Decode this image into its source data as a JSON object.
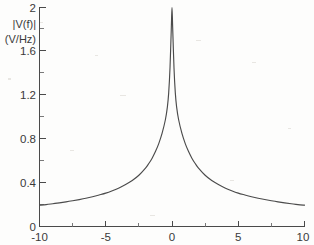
{
  "figure": {
    "background_color": "#fdfdfc",
    "curve_color": "#4b4b4b",
    "axis_color": "#4a4a4a"
  },
  "axes": {
    "y_axis_title_line1": "|V(f)|",
    "y_axis_title_line2": "(V/Hz)",
    "x_axis_title": "",
    "y_ticks": [
      "0",
      "0.4",
      "0.8",
      "1.2",
      "1.6",
      "2"
    ],
    "y_tick_values": [
      0,
      0.4,
      0.8,
      1.2,
      1.6,
      2
    ],
    "x_ticks": [
      "-10",
      "-5",
      "0",
      "5",
      "10"
    ],
    "x_tick_values": [
      -10,
      -5,
      0,
      5,
      10
    ]
  },
  "chart_data": {
    "type": "line",
    "title": "",
    "xlabel": "",
    "ylabel": "|V(f)| (V/Hz)",
    "xlim": [
      -10,
      10
    ],
    "ylim": [
      0,
      2
    ],
    "grid": false,
    "legend": null,
    "x_tick_labels": [
      "-10",
      "-5",
      "0",
      "5",
      "10"
    ],
    "y_tick_labels": [
      "0",
      "0.4",
      "0.8",
      "1.2",
      "1.6",
      "2"
    ],
    "x_minor_tick_interval": 1.25,
    "y_minor_tick_interval": 0.2,
    "series": [
      {
        "name": "|V(f)|",
        "color": "#4b4b4b",
        "x": [
          -10,
          -9.5,
          -9,
          -8.5,
          -8,
          -7.5,
          -7,
          -6.5,
          -6,
          -5.5,
          -5,
          -4.5,
          -4,
          -3.5,
          -3,
          -2.5,
          -2,
          -1.75,
          -1.5,
          -1.25,
          -1,
          -0.75,
          -0.5,
          -0.35,
          -0.25,
          -0.15,
          -0.05,
          0,
          0.05,
          0.15,
          0.25,
          0.35,
          0.5,
          0.75,
          1,
          1.25,
          1.5,
          1.75,
          2,
          2.5,
          3,
          3.5,
          4,
          4.5,
          5,
          5.5,
          6,
          6.5,
          7,
          7.5,
          8,
          8.5,
          9,
          9.5,
          10
        ],
        "y": [
          0.195,
          0.2,
          0.208,
          0.216,
          0.225,
          0.235,
          0.246,
          0.258,
          0.272,
          0.288,
          0.305,
          0.327,
          0.352,
          0.383,
          0.42,
          0.468,
          0.533,
          0.575,
          0.624,
          0.684,
          0.757,
          0.85,
          0.975,
          1.09,
          1.22,
          1.45,
          1.82,
          2.0,
          1.82,
          1.45,
          1.22,
          1.09,
          0.975,
          0.85,
          0.757,
          0.684,
          0.624,
          0.575,
          0.533,
          0.468,
          0.42,
          0.383,
          0.352,
          0.327,
          0.305,
          0.288,
          0.272,
          0.258,
          0.246,
          0.235,
          0.225,
          0.216,
          0.208,
          0.2,
          0.195
        ]
      }
    ],
    "peak": {
      "x": 0,
      "y": 2
    }
  }
}
